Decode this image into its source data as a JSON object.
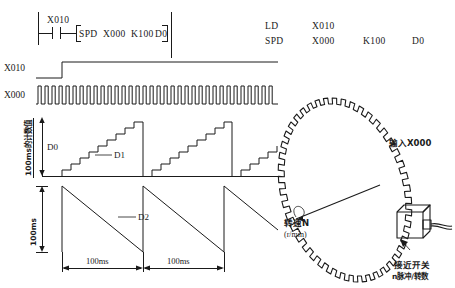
{
  "figure": {
    "kind": "plc-spd-instruction-timing-diagram"
  },
  "ladder": {
    "contact_label": "X010",
    "instruction_bracket_open": "[",
    "instruction_bracket_close": "]",
    "instruction_tokens": [
      "SPD",
      "X000",
      "K100",
      "D0"
    ]
  },
  "instruction_list": {
    "rows": [
      {
        "mnemonic": "LD",
        "operands": [
          "X010",
          "",
          ""
        ]
      },
      {
        "mnemonic": "SPD",
        "operands": [
          "X000",
          "K100",
          "D0"
        ]
      }
    ]
  },
  "timing": {
    "signals": [
      {
        "name": "X010",
        "type": "step"
      },
      {
        "name": "X000",
        "type": "pulse-train"
      }
    ],
    "d0_axis_label": "D0",
    "d0_vertical_caption": "100ms的计数值",
    "d1_label": "D1",
    "d2_label": "D2",
    "d2_vertical_caption": "100ms",
    "period_labels": [
      "100ms",
      "100ms"
    ]
  },
  "illustration": {
    "input_label": "输入X000",
    "speed_label": "转速N",
    "speed_unit": "(r/min)",
    "switch_label_line1": "接近开关",
    "switch_label_line2": "n脉冲/转数"
  },
  "colors": {
    "ink": "#1a1a1a",
    "background": "#ffffff"
  }
}
